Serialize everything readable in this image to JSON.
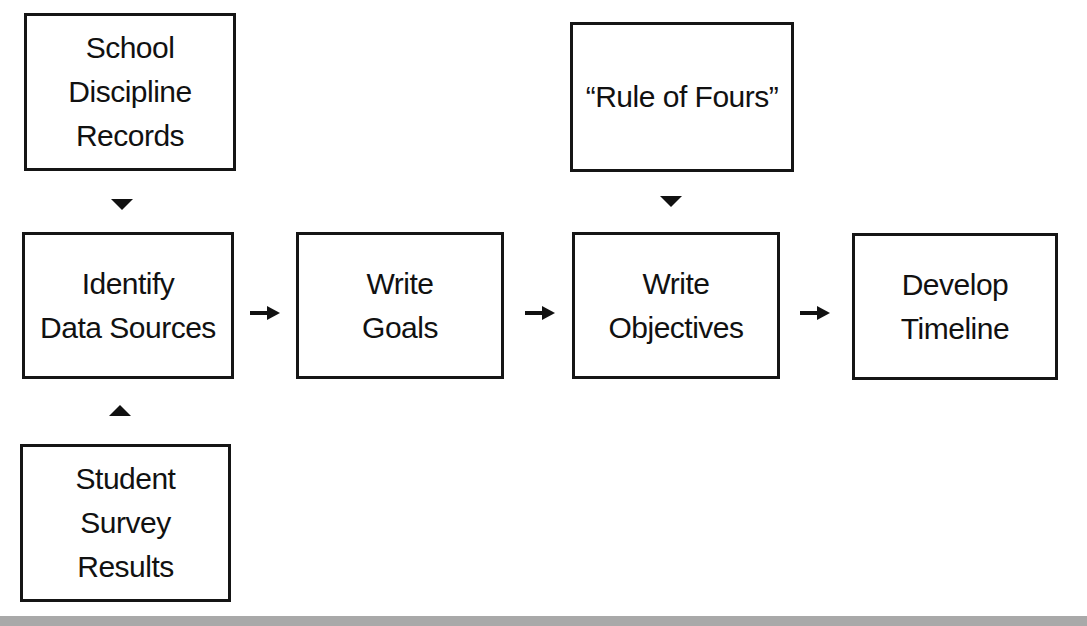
{
  "diagram": {
    "nodes": {
      "school_discipline": {
        "lines": [
          "School",
          "Discipline",
          "Records"
        ]
      },
      "identify_data_sources": {
        "lines": [
          "Identify",
          "Data Sources"
        ]
      },
      "student_survey": {
        "lines": [
          "Student",
          "Survey",
          "Results"
        ]
      },
      "write_goals": {
        "lines": [
          "Write",
          "Goals"
        ]
      },
      "rule_of_fours": {
        "lines": [
          "“Rule of Fours”"
        ]
      },
      "write_objectives": {
        "lines": [
          "Write",
          "Objectives"
        ]
      },
      "develop_timeline": {
        "lines": [
          "Develop",
          "Timeline"
        ]
      }
    },
    "edges": [
      {
        "from": "school_discipline",
        "to": "identify_data_sources",
        "direction": "down"
      },
      {
        "from": "student_survey",
        "to": "identify_data_sources",
        "direction": "up"
      },
      {
        "from": "identify_data_sources",
        "to": "write_goals",
        "direction": "right"
      },
      {
        "from": "write_goals",
        "to": "write_objectives",
        "direction": "right"
      },
      {
        "from": "rule_of_fours",
        "to": "write_objectives",
        "direction": "down"
      },
      {
        "from": "write_objectives",
        "to": "develop_timeline",
        "direction": "right"
      }
    ],
    "colors": {
      "stroke": "#151515",
      "background": "#ffffff",
      "bottom_bar": "#a9a9a9"
    }
  }
}
